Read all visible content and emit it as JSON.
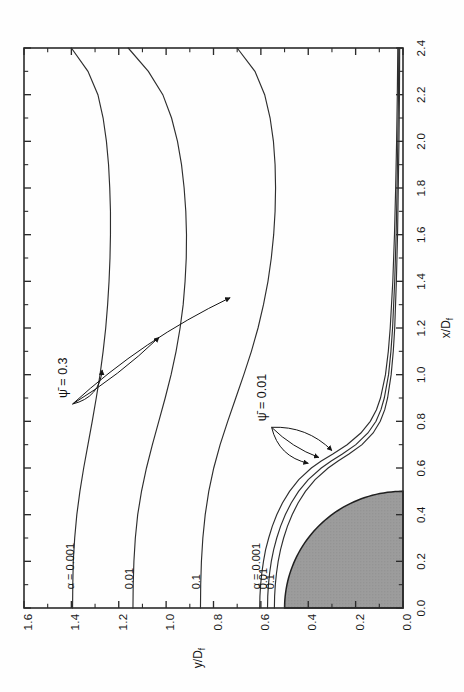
{
  "figure": {
    "name": "streamline-contour-plot",
    "background_color": "#fefefe",
    "ink_color": "#2b2b2b"
  },
  "chart_data": {
    "type": "line",
    "title": "",
    "subtitle": "",
    "orientation": "rotated-90-ccw",
    "xlabel": "x/D_f",
    "ylabel": "y/D_f",
    "xlim": [
      0.0,
      2.4
    ],
    "ylim": [
      0.0,
      1.6
    ],
    "grid": false,
    "legend_position": "inline-annotations",
    "xticks": [
      "0.0",
      "0.2",
      "0.4",
      "0.6",
      "0.8",
      "1.0",
      "1.2",
      "1.4",
      "1.6",
      "1.8",
      "2.0",
      "2.2",
      "2.4"
    ],
    "xtick_values": [
      0.0,
      0.2,
      0.4,
      0.6,
      0.8,
      1.0,
      1.2,
      1.4,
      1.6,
      1.8,
      2.0,
      2.2,
      2.4
    ],
    "x_minor_step": 0.1,
    "yticks": [
      "0.0",
      "0.2",
      "0.4",
      "0.6",
      "0.8",
      "1.0",
      "1.2",
      "1.4",
      "1.6"
    ],
    "ytick_values": [
      0.0,
      0.2,
      0.4,
      0.6,
      0.8,
      1.0,
      1.2,
      1.4,
      1.6
    ],
    "y_minor_step": 0.1,
    "shaded_region": {
      "name": "nozzle-quarter-disk",
      "shape": "quarter-circle",
      "center": [
        0.0,
        0.0
      ],
      "radius": 0.5,
      "fill": "#9c9c9c",
      "stroke": "#202020"
    },
    "series": [
      {
        "name": "psi-0.3-alpha-0.001",
        "group": "psi_0_3",
        "label": "α = 0.001",
        "label_at": [
          0.08,
          1.39
        ],
        "points": [
          [
            0.0,
            1.395
          ],
          [
            0.1,
            1.394
          ],
          [
            0.2,
            1.392
          ],
          [
            0.3,
            1.386
          ],
          [
            0.4,
            1.377
          ],
          [
            0.5,
            1.364
          ],
          [
            0.6,
            1.348
          ],
          [
            0.7,
            1.33
          ],
          [
            0.8,
            1.312
          ],
          [
            0.9,
            1.295
          ],
          [
            1.0,
            1.279
          ],
          [
            1.1,
            1.266
          ],
          [
            1.2,
            1.255
          ],
          [
            1.3,
            1.247
          ],
          [
            1.4,
            1.241
          ],
          [
            1.5,
            1.237
          ],
          [
            1.6,
            1.235
          ],
          [
            1.7,
            1.235
          ],
          [
            1.8,
            1.238
          ],
          [
            1.9,
            1.243
          ],
          [
            2.0,
            1.252
          ],
          [
            2.1,
            1.266
          ],
          [
            2.2,
            1.288
          ],
          [
            2.3,
            1.33
          ],
          [
            2.4,
            1.4
          ]
        ]
      },
      {
        "name": "psi-0.3-alpha-0.01",
        "group": "psi_0_3",
        "label": "0.01",
        "label_at": [
          0.08,
          1.14
        ],
        "points": [
          [
            0.0,
            1.14
          ],
          [
            0.1,
            1.139
          ],
          [
            0.2,
            1.136
          ],
          [
            0.3,
            1.13
          ],
          [
            0.4,
            1.12
          ],
          [
            0.5,
            1.104
          ],
          [
            0.6,
            1.083
          ],
          [
            0.7,
            1.058
          ],
          [
            0.8,
            1.031
          ],
          [
            0.9,
            1.004
          ],
          [
            1.0,
            0.979
          ],
          [
            1.1,
            0.958
          ],
          [
            1.2,
            0.941
          ],
          [
            1.3,
            0.928
          ],
          [
            1.4,
            0.92
          ],
          [
            1.5,
            0.915
          ],
          [
            1.6,
            0.914
          ],
          [
            1.7,
            0.917
          ],
          [
            1.8,
            0.924
          ],
          [
            1.9,
            0.935
          ],
          [
            2.0,
            0.952
          ],
          [
            2.1,
            0.977
          ],
          [
            2.2,
            1.014
          ],
          [
            2.3,
            1.075
          ],
          [
            2.4,
            1.16
          ]
        ]
      },
      {
        "name": "psi-0.3-alpha-0.1",
        "group": "psi_0_3",
        "label": "0.1",
        "label_at": [
          0.08,
          0.855
        ],
        "points": [
          [
            0.0,
            0.855
          ],
          [
            0.1,
            0.854
          ],
          [
            0.2,
            0.851
          ],
          [
            0.3,
            0.845
          ],
          [
            0.4,
            0.835
          ],
          [
            0.5,
            0.82
          ],
          [
            0.6,
            0.799
          ],
          [
            0.7,
            0.772
          ],
          [
            0.8,
            0.74
          ],
          [
            0.9,
            0.706
          ],
          [
            1.0,
            0.672
          ],
          [
            1.1,
            0.64
          ],
          [
            1.2,
            0.612
          ],
          [
            1.3,
            0.589
          ],
          [
            1.4,
            0.57
          ],
          [
            1.5,
            0.556
          ],
          [
            1.6,
            0.546
          ],
          [
            1.7,
            0.54
          ],
          [
            1.8,
            0.538
          ],
          [
            1.9,
            0.54
          ],
          [
            2.0,
            0.547
          ],
          [
            2.1,
            0.561
          ],
          [
            2.2,
            0.584
          ],
          [
            2.3,
            0.625
          ],
          [
            2.4,
            0.7
          ]
        ]
      },
      {
        "name": "psi-0.01-alpha-0.001",
        "group": "psi_0_01",
        "label": "α = 0.001",
        "label_at": [
          0.08,
          0.605
        ],
        "points": [
          [
            0.0,
            0.605
          ],
          [
            0.05,
            0.604
          ],
          [
            0.1,
            0.601
          ],
          [
            0.15,
            0.596
          ],
          [
            0.2,
            0.589
          ],
          [
            0.25,
            0.58
          ],
          [
            0.3,
            0.567
          ],
          [
            0.35,
            0.552
          ],
          [
            0.4,
            0.533
          ],
          [
            0.45,
            0.509
          ],
          [
            0.5,
            0.479
          ],
          [
            0.55,
            0.44
          ],
          [
            0.6,
            0.387
          ],
          [
            0.63,
            0.345
          ],
          [
            0.66,
            0.296
          ],
          [
            0.7,
            0.236
          ],
          [
            0.75,
            0.178
          ],
          [
            0.8,
            0.138
          ],
          [
            0.85,
            0.112
          ],
          [
            0.9,
            0.095
          ],
          [
            1.0,
            0.074
          ],
          [
            1.1,
            0.062
          ],
          [
            1.2,
            0.054
          ],
          [
            1.4,
            0.043
          ],
          [
            1.6,
            0.036
          ],
          [
            1.8,
            0.031
          ],
          [
            2.0,
            0.027
          ],
          [
            2.2,
            0.024
          ],
          [
            2.4,
            0.022
          ]
        ]
      },
      {
        "name": "psi-0.01-alpha-0.01",
        "group": "psi_0_01",
        "label": "0.01",
        "label_at": [
          0.08,
          0.575
        ],
        "points": [
          [
            0.0,
            0.572
          ],
          [
            0.05,
            0.571
          ],
          [
            0.1,
            0.568
          ],
          [
            0.15,
            0.563
          ],
          [
            0.2,
            0.556
          ],
          [
            0.25,
            0.546
          ],
          [
            0.3,
            0.533
          ],
          [
            0.35,
            0.517
          ],
          [
            0.4,
            0.497
          ],
          [
            0.45,
            0.472
          ],
          [
            0.5,
            0.441
          ],
          [
            0.55,
            0.4
          ],
          [
            0.6,
            0.345
          ],
          [
            0.63,
            0.303
          ],
          [
            0.66,
            0.256
          ],
          [
            0.7,
            0.199
          ],
          [
            0.75,
            0.148
          ],
          [
            0.8,
            0.114
          ],
          [
            0.85,
            0.093
          ],
          [
            0.9,
            0.079
          ],
          [
            1.0,
            0.061
          ],
          [
            1.1,
            0.051
          ],
          [
            1.2,
            0.044
          ],
          [
            1.4,
            0.035
          ],
          [
            1.6,
            0.029
          ],
          [
            1.8,
            0.025
          ],
          [
            2.0,
            0.022
          ],
          [
            2.2,
            0.019
          ],
          [
            2.4,
            0.018
          ]
        ]
      },
      {
        "name": "psi-0.01-alpha-0.1",
        "group": "psi_0_01",
        "label": "0.1",
        "label_at": [
          0.08,
          0.545
        ],
        "points": [
          [
            0.0,
            0.543
          ],
          [
            0.05,
            0.542
          ],
          [
            0.1,
            0.539
          ],
          [
            0.15,
            0.534
          ],
          [
            0.2,
            0.527
          ],
          [
            0.25,
            0.517
          ],
          [
            0.3,
            0.504
          ],
          [
            0.35,
            0.488
          ],
          [
            0.4,
            0.468
          ],
          [
            0.45,
            0.443
          ],
          [
            0.5,
            0.412
          ],
          [
            0.55,
            0.371
          ],
          [
            0.6,
            0.316
          ],
          [
            0.63,
            0.274
          ],
          [
            0.66,
            0.228
          ],
          [
            0.7,
            0.173
          ],
          [
            0.75,
            0.126
          ],
          [
            0.8,
            0.096
          ],
          [
            0.85,
            0.077
          ],
          [
            0.9,
            0.065
          ],
          [
            1.0,
            0.05
          ],
          [
            1.1,
            0.041
          ],
          [
            1.2,
            0.035
          ],
          [
            1.4,
            0.028
          ],
          [
            1.6,
            0.023
          ],
          [
            1.8,
            0.02
          ],
          [
            2.0,
            0.017
          ],
          [
            2.2,
            0.015
          ],
          [
            2.4,
            0.014
          ]
        ]
      }
    ],
    "annotations": [
      {
        "name": "psi-0.3-annotation",
        "text": "ψ̄ = 0.3",
        "value": 0.3,
        "anchor": [
          0.9,
          1.42
        ],
        "arrow_targets": [
          [
            1.02,
            1.27
          ],
          [
            1.16,
            1.03
          ],
          [
            1.33,
            0.73
          ]
        ]
      },
      {
        "name": "psi-0.01-annotation",
        "text": "ψ̄ = 0.01",
        "value": 0.01,
        "anchor": [
          0.8,
          0.58
        ],
        "arrow_targets": [
          [
            0.62,
            0.4
          ],
          [
            0.645,
            0.355
          ],
          [
            0.675,
            0.3
          ]
        ]
      }
    ]
  },
  "axes": {
    "x_axis_label": "x/Dₓ",
    "x_axis_label_text": "x/D",
    "x_axis_label_sub": "f",
    "y_axis_label_text": "y/D",
    "y_axis_label_sub": "f"
  }
}
